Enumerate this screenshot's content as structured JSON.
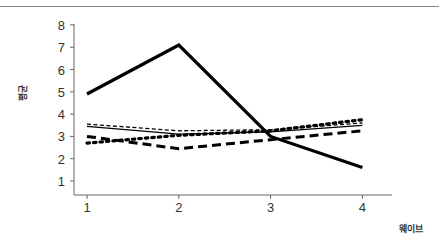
{
  "chart_data": {
    "type": "line",
    "title": "",
    "xlabel": "웨이브",
    "ylabel": "평균",
    "x": [
      1,
      2,
      3,
      4
    ],
    "x_tick_labels": [
      "1",
      "2",
      "3",
      "4"
    ],
    "y_tick_labels": [
      "1",
      "2",
      "3",
      "4",
      "5",
      "6",
      "7",
      "8"
    ],
    "ylim": [
      0.4,
      8.0
    ],
    "xlim": [
      0.85,
      4.3
    ],
    "grid": false,
    "legend": null,
    "series": [
      {
        "name": "thick-solid",
        "style": "solid",
        "width": 3.2,
        "values": [
          4.9,
          7.1,
          3.0,
          1.6
        ]
      },
      {
        "name": "thin-dashed",
        "style": "dashed-thin",
        "width": 1.3,
        "values": [
          3.55,
          3.25,
          3.3,
          3.6
        ]
      },
      {
        "name": "thin-solid",
        "style": "solid",
        "width": 1.3,
        "values": [
          3.45,
          3.1,
          3.2,
          3.5
        ]
      },
      {
        "name": "dotted",
        "style": "dotted",
        "width": 3.2,
        "values": [
          2.7,
          3.05,
          3.25,
          3.75
        ]
      },
      {
        "name": "thick-dashed",
        "style": "dashed-thick",
        "width": 3.0,
        "values": [
          3.0,
          2.45,
          2.85,
          3.25
        ]
      }
    ]
  }
}
